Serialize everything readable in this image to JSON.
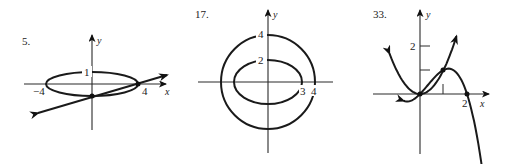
{
  "panels": [
    {
      "number": "5.",
      "x_axis_label": "x",
      "y_axis_label": "y",
      "tick_labels": {
        "x_left": "−4",
        "x_right": "4",
        "y_top": "1"
      },
      "curves": [
        {
          "kind": "ellipse",
          "equation": "x^2/16 + y^2 = 1",
          "a": 4,
          "b": 1
        },
        {
          "kind": "line",
          "through": [
            [
              0,
              -1
            ],
            [
              4,
              0
            ]
          ],
          "arrows": "both"
        }
      ],
      "intersection_points": [
        [
          0,
          -1
        ],
        [
          4,
          0
        ]
      ]
    },
    {
      "number": "17.",
      "x_axis_label": "x",
      "y_axis_label": "y",
      "tick_labels": {
        "outer_y": "4",
        "inner_y": "2",
        "inner_x": "3",
        "outer_x": "4"
      },
      "curves": [
        {
          "kind": "circle",
          "radius": 4
        },
        {
          "kind": "ellipse",
          "a": 3,
          "b": 2
        }
      ]
    },
    {
      "number": "33.",
      "x_axis_label": "x",
      "y_axis_label": "y",
      "tick_labels": {
        "y_tick": "2",
        "x_tick": "2"
      },
      "curves": [
        {
          "kind": "parabola",
          "equation": "y = x^2",
          "arrows": "both"
        },
        {
          "kind": "cubic",
          "through": [
            [
              0,
              0
            ],
            [
              1,
              1
            ],
            [
              2,
              0
            ]
          ],
          "arrows": "both"
        }
      ],
      "intersection_points": [
        [
          0,
          0
        ],
        [
          1,
          1
        ]
      ]
    }
  ]
}
